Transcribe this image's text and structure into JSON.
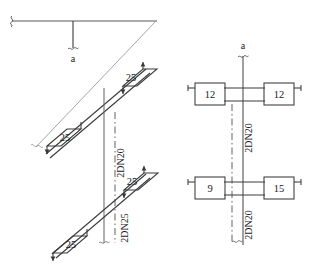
{
  "drawing": {
    "title_fragment": "",
    "section_marker_left": "a",
    "section_marker_right": "a",
    "iso_view": {
      "name": "isometric-riser-view",
      "branch_labels": [
        "25",
        "25",
        "25",
        "25"
      ],
      "pipe_labels": [
        "2DN20",
        "2DN25"
      ]
    },
    "plan_view": {
      "name": "plan-section-view",
      "upper_row": {
        "left_box": "12",
        "right_box": "12",
        "pipe_label": "2DN20"
      },
      "lower_row": {
        "left_box": "9",
        "right_box": "15",
        "pipe_label": "2DN20"
      }
    },
    "colors": {
      "line": "#3a3a3a",
      "thin_line": "#8a8a8a",
      "text": "#1a1a1a",
      "background": "#ffffff"
    }
  }
}
